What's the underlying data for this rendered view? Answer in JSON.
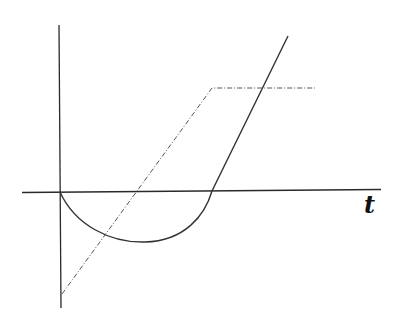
{
  "diagram": {
    "axis_label_t": "t",
    "colors": {
      "axis": "#2a2a2a",
      "solid_curve": "#333333",
      "dashdot_curve": "#555555",
      "background": "#ffffff"
    },
    "elements": [
      {
        "name": "vertical-axis",
        "from": [
          59,
          25
        ],
        "to": [
          61,
          308
        ]
      },
      {
        "name": "horizontal-axis",
        "from": [
          22,
          192
        ],
        "to": [
          381,
          190
        ]
      },
      {
        "name": "solid-curve",
        "description": "semicircular dip below t-axis from origin, then straight rising line",
        "points": [
          [
            60,
            192
          ],
          [
            145,
            242
          ],
          [
            212,
            191
          ],
          [
            288,
            36
          ]
        ]
      },
      {
        "name": "dashdot-curve",
        "description": "ramp from below origin rising to plateau",
        "points": [
          [
            62,
            294
          ],
          [
            212,
            88
          ],
          [
            315,
            88
          ]
        ]
      }
    ]
  }
}
